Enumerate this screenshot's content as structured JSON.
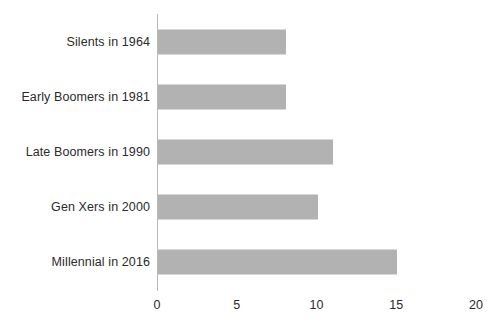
{
  "chart_data": {
    "type": "bar",
    "orientation": "horizontal",
    "title": "",
    "xlabel": "",
    "ylabel": "",
    "categories": [
      "Silents in 1964",
      "Early Boomers in 1981",
      "Late Boomers in 1990",
      "Gen Xers in 2000",
      "Millennial in 2016"
    ],
    "values": [
      8,
      8,
      11,
      10,
      15
    ],
    "xlim": [
      0,
      20
    ],
    "xticks": [
      0,
      5,
      10,
      15,
      20
    ],
    "xtick_labels": [
      "0",
      "5",
      "10",
      "15",
      "20"
    ],
    "grid": false,
    "legend": false,
    "bar_color": "#b2b2b2",
    "axis_color": "#b9b9b9",
    "text_color": "#2b2b2b"
  }
}
